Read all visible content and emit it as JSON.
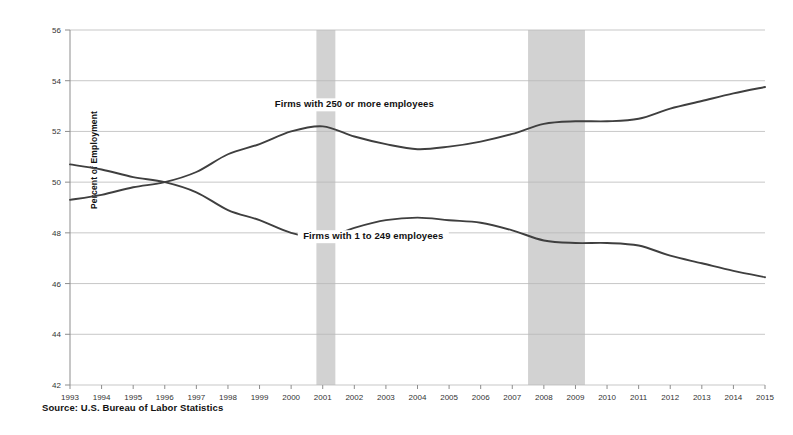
{
  "chart_data": {
    "type": "line",
    "title": "",
    "xlabel": "",
    "ylabel": "Percent of Employment",
    "xlim": [
      1993,
      2015
    ],
    "ylim": [
      42,
      56
    ],
    "ytick_step": 2,
    "grid": true,
    "legend_position": "inline-annotation",
    "source": "Source: U.S. Bureau of Labor Statistics",
    "x": [
      1993,
      1994,
      1995,
      1996,
      1997,
      1998,
      1999,
      2000,
      2001,
      2002,
      2003,
      2004,
      2005,
      2006,
      2007,
      2008,
      2009,
      2010,
      2011,
      2012,
      2013,
      2014,
      2015
    ],
    "xtick_labels": [
      "1993",
      "1994",
      "1995",
      "1996",
      "1997",
      "1998",
      "1999",
      "2000",
      "2001",
      "2002",
      "2003",
      "2004",
      "2005",
      "2006",
      "2007",
      "2008",
      "2009",
      "2010",
      "2011",
      "2012",
      "2013",
      "2014",
      "2015"
    ],
    "ytick_labels": [
      "42",
      "44",
      "46",
      "48",
      "50",
      "52",
      "54",
      "56"
    ],
    "ytick_values": [
      42,
      44,
      46,
      48,
      50,
      52,
      54,
      56
    ],
    "series": [
      {
        "name": "Firms with 250 or more employees",
        "annotation_label": "Firms with 250 or more employees",
        "color": "#3f3f3f",
        "values": [
          49.3,
          49.5,
          49.8,
          50.0,
          50.4,
          51.1,
          51.5,
          52.0,
          52.2,
          51.8,
          51.5,
          51.3,
          51.4,
          51.6,
          51.9,
          52.3,
          52.4,
          52.4,
          52.5,
          52.9,
          53.2,
          53.5,
          53.75
        ]
      },
      {
        "name": "Firms with 1 to 249 employees",
        "annotation_label": "Firms with 1 to 249 employees",
        "color": "#3f3f3f",
        "values": [
          50.7,
          50.5,
          50.2,
          50.0,
          49.6,
          48.9,
          48.5,
          48.0,
          47.8,
          48.2,
          48.5,
          48.6,
          48.5,
          48.4,
          48.1,
          47.7,
          47.6,
          47.6,
          47.5,
          47.1,
          46.8,
          46.5,
          46.25
        ]
      }
    ],
    "shaded_regions": [
      {
        "name": "recession-2001",
        "start": 2000.8,
        "end": 2001.4,
        "color": "#d2d2d2"
      },
      {
        "name": "recession-2008",
        "start": 2007.5,
        "end": 2009.3,
        "color": "#d2d2d2"
      }
    ],
    "annotations": [
      {
        "name": "large-firms-label",
        "text": "Firms with 250 or more employees",
        "x": 2002.0,
        "y": 52.95
      },
      {
        "name": "small-firms-label",
        "text": "Firms with 1 to 249 employees",
        "x": 2002.6,
        "y": 47.75
      }
    ]
  }
}
